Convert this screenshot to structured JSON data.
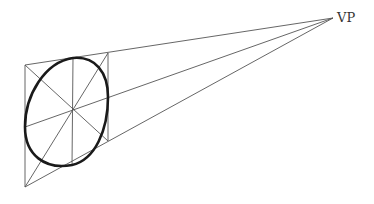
{
  "diagram": {
    "vanishing_point": {
      "label": "VP",
      "x": 333,
      "y": 18
    },
    "square": {
      "top_left": [
        25,
        65
      ],
      "top_right": [
        108,
        53
      ],
      "bottom_right": [
        108,
        141
      ],
      "bottom_left": [
        25,
        187
      ],
      "center": [
        73,
        110
      ]
    },
    "ellipse_tangents": {
      "left": [
        25,
        127
      ],
      "top": [
        73,
        58
      ],
      "right": [
        108,
        97
      ],
      "bottom": [
        72,
        165
      ]
    },
    "colors": {
      "line": "#555555",
      "ellipse": "#1a1a1a",
      "label": "#333333",
      "background": "#ffffff"
    }
  }
}
